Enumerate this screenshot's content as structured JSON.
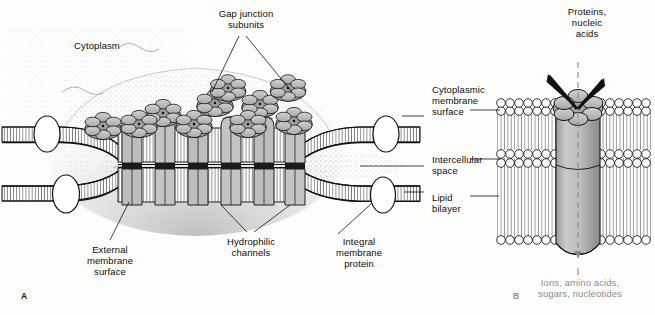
{
  "figure": {
    "type": "diagram",
    "panels": [
      {
        "id": "A",
        "label": "A",
        "caption": "Gap junction between two adjacent cell membranes"
      },
      {
        "id": "B",
        "label": "B",
        "caption": "Cutaway of a single connexon channel in the lipid bilayer"
      }
    ]
  },
  "labels": {
    "cytoplasm": "Cytoplasm",
    "gap_junction_subunits": "Gap junction\nsubunits",
    "cytoplasmic_membrane_surface": "Cytoplasmic\nmembrane\nsurface",
    "intercellular_space": "Intercellular\nspace",
    "lipid_bilayer": "Lipid\nbilayer",
    "external_membrane_surface": "External\nmembrane\nsurface",
    "hydrophilic_channels": "Hydrophilic\nchannels",
    "integral_membrane_protein": "Integral\nmembrane\nprotein",
    "proteins_nucleic_acids": "Proteins,\nnucleic\nacids",
    "permeant_solutes": "Ions, amino acids,\nsugars, nucleotides",
    "panel_a": "A",
    "panel_b": "B"
  },
  "colors": {
    "ink": "#111111",
    "protein_fill": "#b9b9b9",
    "protein_fill_light": "#cfcfcf",
    "cylinder_fill": "#b4b4b4",
    "stipple": "#9a9a9a",
    "gray_caption": "#8d8d8d",
    "background": "#fdfdfc"
  },
  "structures": {
    "connexon_rosettes": 9,
    "channel_columns": 6,
    "integral_proteins": 4,
    "bilayer_leaflets": 2,
    "rosette_lobes": 6
  }
}
